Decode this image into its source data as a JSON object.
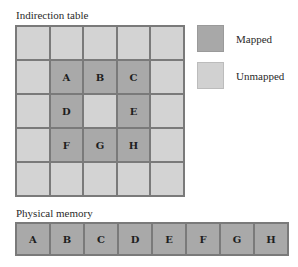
{
  "indirection_table": {
    "title": "Indirection table",
    "rows": [
      [
        {
          "label": "",
          "state": "unmapped"
        },
        {
          "label": "",
          "state": "unmapped"
        },
        {
          "label": "",
          "state": "unmapped"
        },
        {
          "label": "",
          "state": "unmapped"
        },
        {
          "label": "",
          "state": "unmapped"
        }
      ],
      [
        {
          "label": "",
          "state": "unmapped"
        },
        {
          "label": "A",
          "state": "mapped"
        },
        {
          "label": "B",
          "state": "mapped"
        },
        {
          "label": "C",
          "state": "mapped"
        },
        {
          "label": "",
          "state": "unmapped"
        }
      ],
      [
        {
          "label": "",
          "state": "unmapped"
        },
        {
          "label": "D",
          "state": "mapped"
        },
        {
          "label": "",
          "state": "unmapped"
        },
        {
          "label": "E",
          "state": "mapped"
        },
        {
          "label": "",
          "state": "unmapped"
        }
      ],
      [
        {
          "label": "",
          "state": "unmapped"
        },
        {
          "label": "F",
          "state": "mapped"
        },
        {
          "label": "G",
          "state": "mapped"
        },
        {
          "label": "H",
          "state": "mapped"
        },
        {
          "label": "",
          "state": "unmapped"
        }
      ],
      [
        {
          "label": "",
          "state": "unmapped"
        },
        {
          "label": "",
          "state": "unmapped"
        },
        {
          "label": "",
          "state": "unmapped"
        },
        {
          "label": "",
          "state": "unmapped"
        },
        {
          "label": "",
          "state": "unmapped"
        }
      ]
    ]
  },
  "legend": {
    "mapped": {
      "label": "Mapped",
      "color": "#a9a9a9"
    },
    "unmapped": {
      "label": "Unmapped",
      "color": "#d3d3d3"
    }
  },
  "physical_memory": {
    "title": "Physical memory",
    "cells": [
      "A",
      "B",
      "C",
      "D",
      "E",
      "F",
      "G",
      "H"
    ]
  }
}
